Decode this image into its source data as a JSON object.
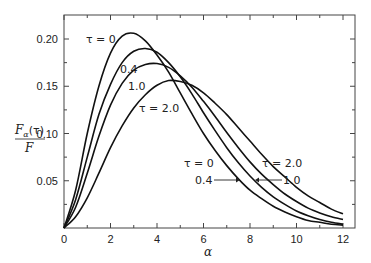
{
  "chart_data": {
    "type": "line",
    "title": "",
    "xlabel": "α",
    "ylabel": "F_α(τ) / F",
    "xlim": [
      0,
      12.5
    ],
    "ylim": [
      0,
      0.22
    ],
    "grid": false,
    "legend": "inline annotations",
    "x_ticks": [
      0,
      2,
      4,
      6,
      8,
      10,
      12
    ],
    "x_tick_labels": [
      "0",
      "2",
      "4",
      "6",
      "8",
      "10",
      "12"
    ],
    "y_ticks": [
      0.05,
      0.1,
      0.15,
      0.2
    ],
    "y_tick_labels": [
      "0.05",
      "0.10",
      "0.15",
      "0.20"
    ],
    "x": [
      0,
      0.5,
      1,
      1.5,
      2,
      2.5,
      3,
      3.5,
      4,
      4.5,
      5,
      5.5,
      6,
      6.5,
      7,
      7.5,
      8,
      8.5,
      9,
      9.5,
      10,
      10.5,
      11,
      11.5,
      12
    ],
    "series": [
      {
        "name": "τ = 0",
        "values": [
          0,
          0.04,
          0.1,
          0.15,
          0.185,
          0.203,
          0.206,
          0.198,
          0.183,
          0.165,
          0.143,
          0.121,
          0.1,
          0.082,
          0.066,
          0.052,
          0.04,
          0.031,
          0.023,
          0.017,
          0.012,
          0.008,
          0.006,
          0.004,
          0.003
        ]
      },
      {
        "name": "τ = 0.4",
        "values": [
          0,
          0.03,
          0.075,
          0.12,
          0.152,
          0.175,
          0.187,
          0.19,
          0.186,
          0.175,
          0.16,
          0.142,
          0.122,
          0.103,
          0.085,
          0.069,
          0.055,
          0.043,
          0.033,
          0.025,
          0.018,
          0.013,
          0.009,
          0.006,
          0.004
        ]
      },
      {
        "name": "τ = 1.0",
        "values": [
          0,
          0.022,
          0.058,
          0.097,
          0.13,
          0.153,
          0.167,
          0.173,
          0.174,
          0.17,
          0.161,
          0.149,
          0.134,
          0.118,
          0.101,
          0.085,
          0.07,
          0.057,
          0.046,
          0.036,
          0.028,
          0.021,
          0.016,
          0.012,
          0.009
        ]
      },
      {
        "name": "τ = 2.0",
        "values": [
          0,
          0.012,
          0.032,
          0.058,
          0.085,
          0.108,
          0.127,
          0.141,
          0.151,
          0.156,
          0.155,
          0.151,
          0.143,
          0.132,
          0.12,
          0.106,
          0.092,
          0.078,
          0.065,
          0.054,
          0.043,
          0.034,
          0.027,
          0.02,
          0.015
        ]
      }
    ],
    "annotations": [
      {
        "text": "τ = 0",
        "near": "peak of τ=0 curve (left)"
      },
      {
        "text": "0.4",
        "near": "rising side of τ=0.4 curve"
      },
      {
        "text": "1.0",
        "near": "rising side of τ=1.0 curve"
      },
      {
        "text": "τ = 2.0",
        "near": "rising side of τ=2.0 curve"
      },
      {
        "text": "τ = 0",
        "near": "falling side, right"
      },
      {
        "text": "0.4",
        "near": "arrow to τ=0.4 curve, right"
      },
      {
        "text": "1.0",
        "near": "arrow to τ=1.0 curve, right"
      },
      {
        "text": "τ = 2.0",
        "near": "falling side τ=2.0, right"
      }
    ]
  },
  "labels": {
    "ylabel_num": "F",
    "ylabel_sub": "α",
    "ylabel_tau": "(τ)",
    "ylabel_den": "F",
    "xlabel": "α",
    "left_tau0": "τ = 0",
    "left_04": "0.4",
    "left_10": "1.0",
    "left_tau2": "τ = 2.0",
    "right_tau0": "τ = 0",
    "right_04": "0.4",
    "right_10": "1.0",
    "right_tau2": "τ = 2.0"
  }
}
